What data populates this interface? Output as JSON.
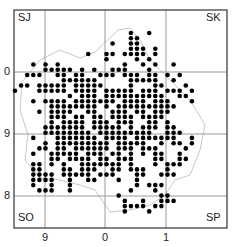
{
  "map": {
    "frame": {
      "x": 14,
      "y": 10,
      "w": 213,
      "h": 218
    },
    "grid_x": [
      45,
      105,
      166
    ],
    "grid_y": [
      72,
      134,
      196
    ],
    "colors": {
      "frame": "#333333",
      "grid": "#9a9a9a",
      "boundary": "#c8c8c8",
      "dot": "#000000"
    },
    "corner_labels": {
      "top_left": "SJ",
      "top_right": "SK",
      "bottom_left": "SO",
      "bottom_right": "SP"
    },
    "y_axis_labels": [
      {
        "text": "0",
        "y": 72
      },
      {
        "text": "9",
        "y": 134
      },
      {
        "text": "8",
        "y": 196
      }
    ],
    "x_axis_labels": [
      {
        "text": "9",
        "x": 45
      },
      {
        "text": "0",
        "x": 105
      },
      {
        "text": "1",
        "x": 166
      }
    ],
    "dots": {
      "origin_x": 15,
      "origin_y": 33,
      "pitch": 6.1,
      "rows": [
        "...................#..#..........",
        "...................##............",
        "................#..##............",
        "...................###.#...........",
        "............#..##.####.#.........",
        "...............#....#.#..........",
        "...#.#.#..........#..#.#..#......",
        ".....#####.#.#..###...#..........",
        "..###..##.##..###.###.##.#.#.....",
        "........######.....#####..#......",
        ".##.#####.#####....#...##...#.....",
        "#...#####.####.#####.###.###.#....",
        ".........#.###.##########..##.....",
        "...#.####.#######.####.###...#....",
        "......########.#.##########.......",
        "....#.####..##..###.##.###........",
        "......###.##.##.####.####.......",
        "......#.####.###.###..##.#........",
        ".....#######.#####.#.###.##.......",
        ".....########.#########..###.....",
        "...#...#######.####.#######..#....",
        ".....#.#########.#####..#.##.#....",
        "....##.##.######.###.###....#.....",
        "...#..#####.###.##.#.#.##..#......",
        "......##.####.##.###...##..##.....",
        "...##.#.#..#######.#...#.###.......",
        "...##...##.###..##.###...#........",
        "...####.#####.###...##..###.......",
        "...####..#..##...#..#.............",
        "...#..#..#..........#.###.........",
        "....###..#.........#...#..........",
        ".................#......##.........",
        "..................#..#..###........",
        "..................####.##.........",
        "..................#...#............"
      ]
    }
  }
}
